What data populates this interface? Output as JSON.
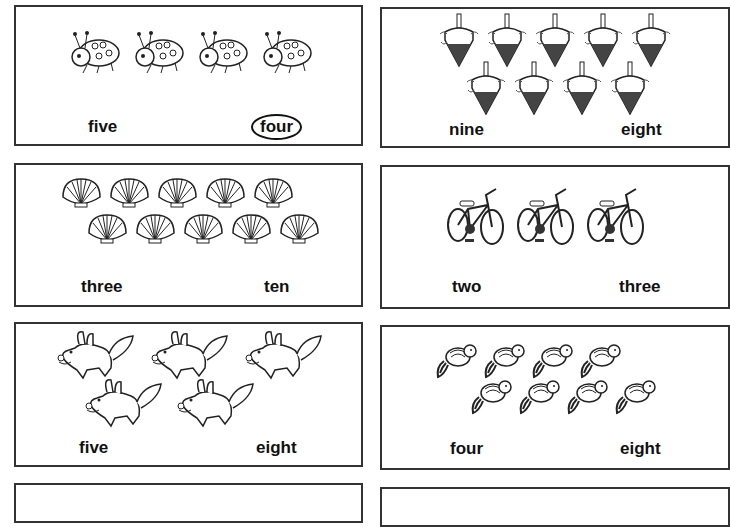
{
  "worksheet": {
    "cards": [
      {
        "id": "ladybugs",
        "object": "ladybug",
        "count_shown": 4,
        "choices": [
          "five",
          "four"
        ],
        "selected": "four"
      },
      {
        "id": "tops",
        "object": "spinning-top",
        "count_shown": 9,
        "choices": [
          "nine",
          "eight"
        ],
        "selected": null
      },
      {
        "id": "shells",
        "object": "seashell",
        "count_shown": 10,
        "choices": [
          "three",
          "ten"
        ],
        "selected": null
      },
      {
        "id": "bikes",
        "object": "bicycle",
        "count_shown": 3,
        "choices": [
          "two",
          "three"
        ],
        "selected": null
      },
      {
        "id": "dogs",
        "object": "puppy",
        "count_shown": 5,
        "choices": [
          "five",
          "eight"
        ],
        "selected": null
      },
      {
        "id": "chipmunks",
        "object": "chipmunk",
        "count_shown": 8,
        "choices": [
          "four",
          "eight"
        ],
        "selected": null
      }
    ]
  }
}
